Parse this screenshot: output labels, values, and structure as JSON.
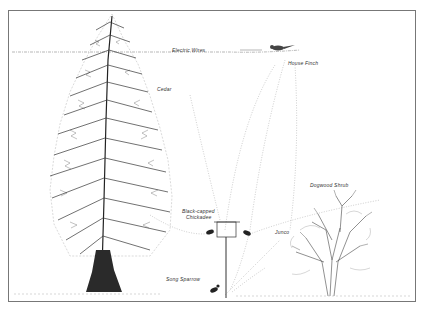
{
  "illustration": {
    "labels": {
      "electric_wires": "Electric Wires",
      "house_finch": "House Finch",
      "cedar": "Cedar",
      "chickadee_line1": "Black-capped",
      "chickadee_line2": "Chickadee",
      "dogwood": "Dogwood Shrub",
      "junco": "Junco",
      "song_sparrow": "Song Sparrow"
    },
    "colors": {
      "ink": "#333333",
      "frame": "#777777",
      "paper": "#ffffff"
    }
  }
}
